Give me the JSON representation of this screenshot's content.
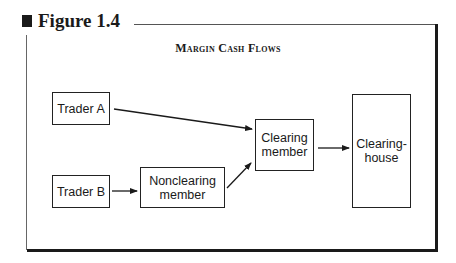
{
  "figure": {
    "label": "Figure 1.4",
    "title": "Margin Cash Flows"
  },
  "nodes": {
    "trader_a": "Trader A",
    "trader_b": "Trader B",
    "nonclearing": "Nonclearing member",
    "clearing_member": "Clearing member",
    "clearinghouse": "Clearing-house"
  },
  "edges": [
    {
      "from": "Trader A",
      "to": "Clearing member"
    },
    {
      "from": "Trader B",
      "to": "Nonclearing member"
    },
    {
      "from": "Nonclearing member",
      "to": "Clearing member"
    },
    {
      "from": "Clearing member",
      "to": "Clearing-house"
    }
  ]
}
